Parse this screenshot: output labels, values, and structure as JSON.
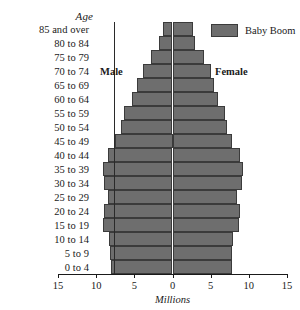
{
  "chart_data": {
    "type": "bar",
    "subtype": "population-pyramid",
    "title": "",
    "xlabel": "Millions",
    "ylabel": "Age",
    "xlim": [
      -15,
      15
    ],
    "xticks": [
      15,
      10,
      5,
      0,
      5,
      10,
      15
    ],
    "grid": false,
    "legend": {
      "position": "top-right",
      "entries": [
        {
          "label": "Baby Boom",
          "color": "#6e6e6e"
        }
      ]
    },
    "annotations": [
      {
        "text": "Male",
        "side": "left"
      },
      {
        "text": "Female",
        "side": "right"
      }
    ],
    "categories": [
      "85 and over",
      "80 to 84",
      "75 to 79",
      "70 to 74",
      "65 to 69",
      "60 to 64",
      "55 to 59",
      "50 to 54",
      "45 to 49",
      "40 to 44",
      "35 to 39",
      "30 to 34",
      "25 to 29",
      "20 to 24",
      "15 to 19",
      "10 to 14",
      "5 to 9",
      "0 to 4"
    ],
    "series": [
      {
        "name": "Male",
        "side": "left",
        "color": "#6e6e6e",
        "values": [
          1.3,
          1.8,
          2.8,
          3.9,
          4.6,
          5.3,
          6.4,
          6.7,
          7.5,
          8.5,
          9.1,
          9.0,
          8.5,
          9.0,
          9.1,
          8.3,
          8.2,
          8.1
        ]
      },
      {
        "name": "Female",
        "side": "right",
        "color": "#6e6e6e",
        "values": [
          2.7,
          3.0,
          4.1,
          5.0,
          5.4,
          5.9,
          6.9,
          7.1,
          7.8,
          8.8,
          9.3,
          9.1,
          8.5,
          8.8,
          8.7,
          7.9,
          7.8,
          7.8
        ]
      }
    ]
  },
  "axis": {
    "y_header": "Age",
    "x_title": "Millions",
    "tick_labels": [
      "15",
      "10",
      "5",
      "0",
      "5",
      "10",
      "15"
    ]
  },
  "labels": {
    "male": "Male",
    "female": "Female"
  },
  "legend": {
    "baby_boom": "Baby Boom"
  }
}
